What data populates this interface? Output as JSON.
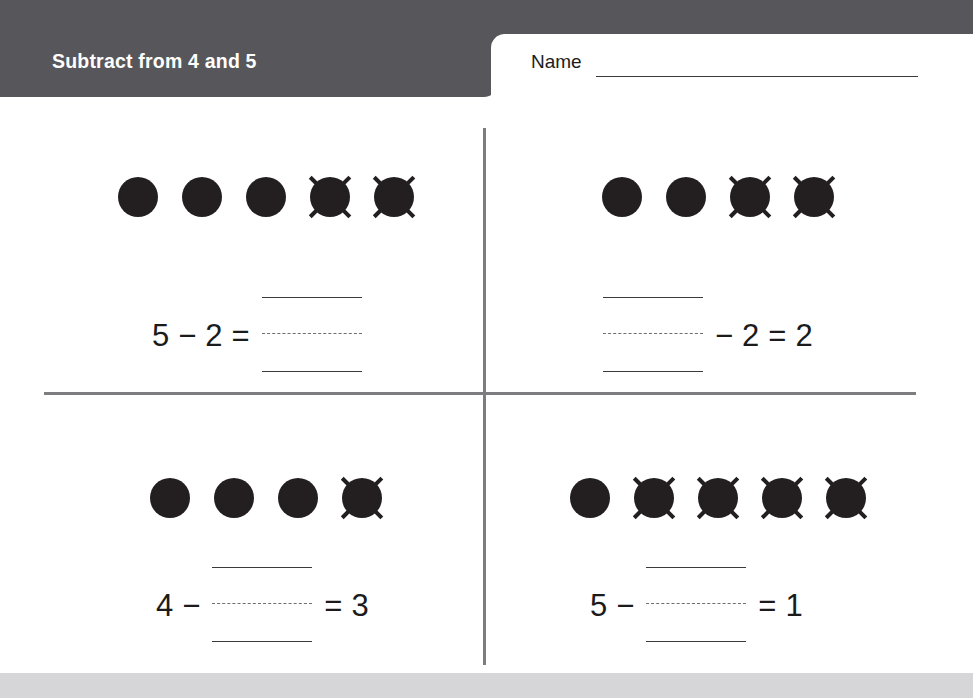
{
  "header": {
    "title": "Subtract from 4 and 5",
    "name_label": "Name",
    "name_value": "",
    "banner_color": "#57575b"
  },
  "worksheet": {
    "dot_color": "#231f20",
    "divider_color": "#7d7d81",
    "problems": [
      {
        "id": "problem-1",
        "position": "top-left",
        "total_dots": 5,
        "crossed_out": 2,
        "blank_position": "result",
        "parts": [
          {
            "kind": "number",
            "text": "5"
          },
          {
            "kind": "operator",
            "text": "−"
          },
          {
            "kind": "number",
            "text": "2"
          },
          {
            "kind": "operator",
            "text": "="
          },
          {
            "kind": "blank",
            "text": ""
          }
        ],
        "equation_text": "5 − 2 = ___"
      },
      {
        "id": "problem-2",
        "position": "top-right",
        "total_dots": 4,
        "crossed_out": 2,
        "blank_position": "minuend",
        "parts": [
          {
            "kind": "blank",
            "text": ""
          },
          {
            "kind": "operator",
            "text": "−"
          },
          {
            "kind": "number",
            "text": "2"
          },
          {
            "kind": "operator",
            "text": "="
          },
          {
            "kind": "number",
            "text": "2"
          }
        ],
        "equation_text": "___ − 2 = 2"
      },
      {
        "id": "problem-3",
        "position": "bottom-left",
        "total_dots": 4,
        "crossed_out": 1,
        "blank_position": "subtrahend",
        "parts": [
          {
            "kind": "number",
            "text": "4"
          },
          {
            "kind": "operator",
            "text": "−"
          },
          {
            "kind": "blank",
            "text": ""
          },
          {
            "kind": "operator",
            "text": "="
          },
          {
            "kind": "number",
            "text": "3"
          }
        ],
        "equation_text": "4 − ___ = 3"
      },
      {
        "id": "problem-4",
        "position": "bottom-right",
        "total_dots": 5,
        "crossed_out": 4,
        "blank_position": "subtrahend",
        "parts": [
          {
            "kind": "number",
            "text": "5"
          },
          {
            "kind": "operator",
            "text": "−"
          },
          {
            "kind": "blank",
            "text": ""
          },
          {
            "kind": "operator",
            "text": "="
          },
          {
            "kind": "number",
            "text": "1"
          }
        ],
        "equation_text": "5 − ___ = 1"
      }
    ]
  }
}
